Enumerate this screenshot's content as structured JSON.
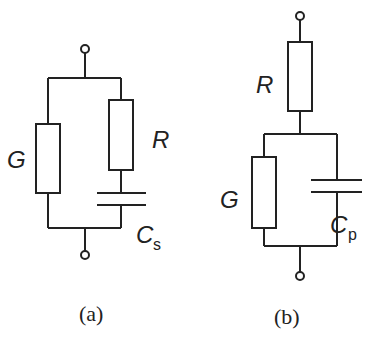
{
  "figure": {
    "panels": [
      {
        "id": "a",
        "caption": "(a)",
        "topology": "G in parallel with (R in series with Cs)",
        "components": {
          "G": {
            "label": "G"
          },
          "R": {
            "label": "R"
          },
          "C": {
            "label": "C",
            "subscript": "s"
          }
        }
      },
      {
        "id": "b",
        "caption": "(b)",
        "topology": "R in series with (G in parallel with Cp)",
        "components": {
          "R": {
            "label": "R"
          },
          "G": {
            "label": "G"
          },
          "C": {
            "label": "C",
            "subscript": "p"
          }
        }
      }
    ]
  },
  "colors": {
    "line": "#222222",
    "background": "#ffffff"
  }
}
